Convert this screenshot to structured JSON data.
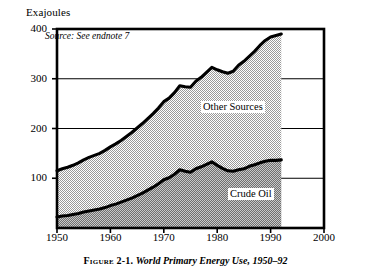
{
  "chart_data": {
    "type": "area",
    "stacked": true,
    "title": "World Primary Energy Use, 1950–92",
    "figure_number": "Figure 2-1.",
    "caption": "Figure 2-1. World Primary Energy Use, 1950–92",
    "source_note": "Source: See endnote 7",
    "xlabel": "",
    "ylabel": "Exajoules",
    "yunit_label": "Exajoules",
    "xlim": [
      1950,
      2000
    ],
    "ylim": [
      0,
      400
    ],
    "yticks": [
      100,
      200,
      300,
      400
    ],
    "ytick_labels": [
      "100",
      "200",
      "300",
      "400"
    ],
    "xticks": [
      1950,
      1960,
      1970,
      1980,
      1990,
      2000
    ],
    "xtick_labels": [
      "1950",
      "1960",
      "1970",
      "1980",
      "1990",
      "2000"
    ],
    "grid": "horizontal",
    "legend": "inline-labels",
    "data_end_year": 1992,
    "x": [
      1950,
      1951,
      1952,
      1953,
      1954,
      1955,
      1956,
      1957,
      1958,
      1959,
      1960,
      1961,
      1962,
      1963,
      1964,
      1965,
      1966,
      1967,
      1968,
      1969,
      1970,
      1971,
      1972,
      1973,
      1974,
      1975,
      1976,
      1977,
      1978,
      1979,
      1980,
      1981,
      1982,
      1983,
      1984,
      1985,
      1986,
      1987,
      1988,
      1989,
      1990,
      1991,
      1992
    ],
    "series": [
      {
        "name": "Crude Oil",
        "label": "Crude Oil",
        "fill": "#8a8a8a",
        "values": [
          22,
          24,
          25,
          27,
          29,
          32,
          34,
          36,
          38,
          41,
          45,
          48,
          52,
          56,
          60,
          65,
          70,
          76,
          82,
          89,
          97,
          101,
          108,
          117,
          114,
          112,
          119,
          123,
          128,
          133,
          126,
          120,
          115,
          114,
          117,
          119,
          124,
          127,
          131,
          134,
          136,
          136,
          137
        ]
      },
      {
        "name": "Other Sources",
        "label": "Other Sources",
        "fill": "#d0d0d0",
        "values": [
          93,
          95,
          97,
          99,
          102,
          105,
          108,
          110,
          112,
          115,
          118,
          121,
          124,
          128,
          132,
          136,
          140,
          144,
          148,
          152,
          157,
          160,
          164,
          169,
          170,
          171,
          176,
          180,
          185,
          190,
          192,
          194,
          196,
          201,
          210,
          216,
          221,
          228,
          236,
          243,
          248,
          251,
          253
        ]
      }
    ],
    "total": {
      "name": "Total Primary Energy",
      "values": [
        115,
        119,
        122,
        126,
        131,
        137,
        142,
        146,
        150,
        156,
        163,
        169,
        176,
        184,
        192,
        201,
        210,
        220,
        230,
        241,
        254,
        261,
        272,
        286,
        284,
        283,
        295,
        303,
        313,
        323,
        318,
        314,
        311,
        315,
        327,
        335,
        345,
        355,
        367,
        377,
        384,
        387,
        390
      ]
    }
  }
}
